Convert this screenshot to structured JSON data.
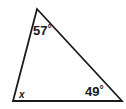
{
  "figure": {
    "type": "geometry-diagram",
    "shape": "triangle",
    "background_color": "#ffffff",
    "stroke_color": "#1a1a1a",
    "stroke_width": 1.8,
    "vertices": {
      "apex": {
        "x": 37,
        "y": 9
      },
      "bottom_left": {
        "x": 13,
        "y": 101
      },
      "bottom_right": {
        "x": 122,
        "y": 101
      }
    },
    "labels": {
      "apex_angle": "57",
      "apex_angle_unit": "°",
      "right_angle": "49",
      "right_angle_unit": "°",
      "left_angle": "x"
    }
  }
}
